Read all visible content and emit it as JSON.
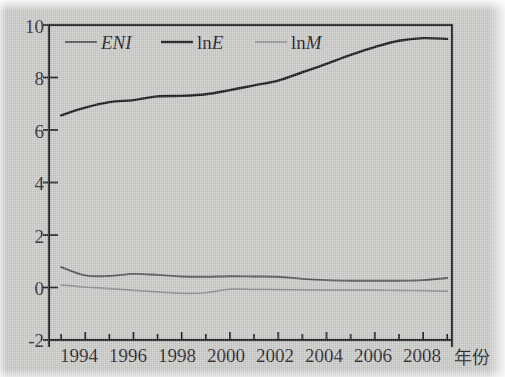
{
  "chart_data": {
    "type": "line",
    "title": "",
    "subtitle": "",
    "xlabel": "年份",
    "ylabel": "",
    "xlim": [
      1992.5,
      2009.2
    ],
    "ylim": [
      -2,
      10
    ],
    "y_ticks": [
      -2,
      0,
      2,
      4,
      6,
      8,
      10
    ],
    "y_tick_labels": [
      "-2",
      "0",
      "2",
      "4",
      "6",
      "8",
      "10"
    ],
    "x_ticks": [
      1993,
      1994,
      1995,
      1996,
      1997,
      1998,
      1999,
      2000,
      2001,
      2002,
      2003,
      2004,
      2005,
      2006,
      2007,
      2008,
      2009
    ],
    "x_tick_labels": [
      "1994",
      "1996",
      "1998",
      "2000",
      "2002",
      "2004",
      "2006",
      "2008"
    ],
    "x_labeled_ticks": [
      1994,
      1996,
      1998,
      2000,
      2002,
      2004,
      2006,
      2008
    ],
    "grid": false,
    "legend_position": "top-left-inside",
    "x": [
      1993,
      1994,
      1995,
      1996,
      1997,
      1998,
      1999,
      2000,
      2001,
      2002,
      2003,
      2004,
      2005,
      2006,
      2007,
      2008,
      2009
    ],
    "series": [
      {
        "name": "ENI",
        "color": "#4d4d4d",
        "width": 1.9,
        "values": [
          0.78,
          0.46,
          0.44,
          0.52,
          0.48,
          0.42,
          0.41,
          0.43,
          0.42,
          0.41,
          0.33,
          0.28,
          0.26,
          0.26,
          0.26,
          0.28,
          0.36
        ]
      },
      {
        "name": "lnE",
        "color": "#111111",
        "width": 2.4,
        "values": [
          6.56,
          6.85,
          7.06,
          7.14,
          7.28,
          7.3,
          7.36,
          7.52,
          7.7,
          7.88,
          8.2,
          8.52,
          8.86,
          9.16,
          9.4,
          9.5,
          9.47
        ]
      },
      {
        "name": "lnM",
        "color": "#8d8d8d",
        "width": 1.7,
        "values": [
          0.1,
          0.02,
          -0.04,
          -0.11,
          -0.17,
          -0.22,
          -0.2,
          -0.06,
          -0.07,
          -0.08,
          -0.09,
          -0.1,
          -0.1,
          -0.1,
          -0.11,
          -0.12,
          -0.14
        ]
      }
    ]
  },
  "legend": {
    "items": [
      {
        "label": "ENI",
        "italic": true,
        "roman_prefix": ""
      },
      {
        "label": "lnE",
        "italic": false,
        "roman_prefix": "ln"
      },
      {
        "label": "lnM",
        "italic": false,
        "roman_prefix": "ln"
      }
    ],
    "entry1_roman": "ln",
    "entry1_italic": "E",
    "entry2_roman": "ln",
    "entry2_italic": "M",
    "entry0_italic": "ENI"
  },
  "axis": {
    "x_title": "年份"
  },
  "colors": {
    "background": "#c9c9c7",
    "axis": "#1a1a1a",
    "eni": "#4d4d4d",
    "lne": "#111111",
    "lnm": "#8d8d8d"
  }
}
